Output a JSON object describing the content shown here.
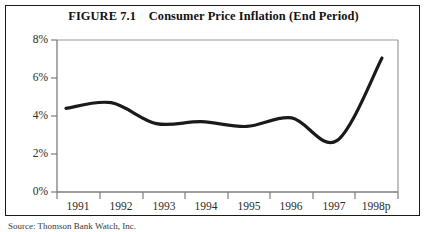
{
  "figure": {
    "frame_border_color": "#1a1a1a",
    "background_color": "#ffffff",
    "title_label": "FIGURE 7.1    Consumer Price Inflation (End Period)",
    "source_note": "Source: Thomson Bank Watch, Inc."
  },
  "chart_data": {
    "type": "line",
    "title": "FIGURE 7.1    Consumer Price Inflation (End Period)",
    "xlabel": "",
    "ylabel": "",
    "grid": false,
    "legend": "none",
    "line_color": "#1a1a1a",
    "line_width": 3.2,
    "axis_color": "#999999",
    "xlim": [
      1990.6,
      1998.6
    ],
    "ylim": [
      0,
      8
    ],
    "ytick_labels": [
      "8%",
      "6%",
      "4%",
      "2%",
      "0%"
    ],
    "ytick_values": [
      8,
      6,
      4,
      2,
      0
    ],
    "xtick_labels": [
      "1991",
      "1992",
      "1993",
      "1994",
      "1995",
      "1996",
      "1997",
      "1998p"
    ],
    "categories": [
      "1991",
      "1992",
      "1993",
      "1994",
      "1995",
      "1996",
      "1997",
      "1998p"
    ],
    "x": [
      1991,
      1992,
      1993,
      1994,
      1995,
      1996,
      1997,
      1998
    ],
    "values": [
      4.4,
      4.7,
      3.6,
      3.7,
      3.45,
      3.9,
      2.7,
      7.05
    ],
    "series": [
      {
        "name": "Consumer Price Inflation (End Period)",
        "values": [
          4.4,
          4.7,
          3.6,
          3.7,
          3.45,
          3.9,
          2.7,
          7.05
        ]
      }
    ]
  }
}
